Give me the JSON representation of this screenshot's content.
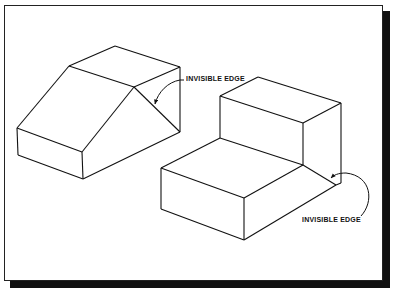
{
  "figure": {
    "stroke_color": "#111111",
    "shadow_color": "#111111",
    "background": "#ffffff"
  },
  "labels": [
    {
      "text": "INVISIBLE EDGE",
      "x": 186,
      "y": 76
    },
    {
      "text": "INVISIBLE EDGE",
      "x": 302,
      "y": 217
    }
  ],
  "shapes": {
    "left_block": {
      "name": "sloped block",
      "edges": [
        [
          [
            69,
            66
          ],
          [
            115,
            46
          ]
        ],
        [
          [
            115,
            46
          ],
          [
            180,
            67
          ]
        ],
        [
          [
            69,
            66
          ],
          [
            134,
            87
          ]
        ],
        [
          [
            134,
            87
          ],
          [
            180,
            67
          ]
        ],
        [
          [
            69,
            66
          ],
          [
            17,
            128
          ]
        ],
        [
          [
            134,
            87
          ],
          [
            82,
            152
          ]
        ],
        [
          [
            134,
            87
          ],
          [
            180,
            132
          ]
        ],
        [
          [
            17,
            128
          ],
          [
            82,
            152
          ]
        ],
        [
          [
            17,
            128
          ],
          [
            18,
            155
          ]
        ],
        [
          [
            82,
            152
          ],
          [
            83,
            179
          ]
        ],
        [
          [
            18,
            155
          ],
          [
            83,
            179
          ]
        ],
        [
          [
            83,
            179
          ],
          [
            180,
            132
          ]
        ],
        [
          [
            180,
            67
          ],
          [
            180,
            132
          ]
        ]
      ]
    },
    "right_block": {
      "name": "stepped block",
      "edges": [
        [
          [
            220,
            96
          ],
          [
            258,
            77
          ]
        ],
        [
          [
            258,
            77
          ],
          [
            341,
            103
          ]
        ],
        [
          [
            220,
            96
          ],
          [
            303,
            123
          ]
        ],
        [
          [
            303,
            123
          ],
          [
            341,
            103
          ]
        ],
        [
          [
            220,
            96
          ],
          [
            220,
            138
          ]
        ],
        [
          [
            303,
            123
          ],
          [
            303,
            165
          ]
        ],
        [
          [
            341,
            103
          ],
          [
            341,
            183
          ]
        ],
        [
          [
            220,
            138
          ],
          [
            161,
            168
          ]
        ],
        [
          [
            220,
            138
          ],
          [
            303,
            165
          ]
        ],
        [
          [
            161,
            168
          ],
          [
            244,
            198
          ]
        ],
        [
          [
            244,
            198
          ],
          [
            303,
            165
          ]
        ],
        [
          [
            303,
            165
          ],
          [
            336,
            185
          ]
        ],
        [
          [
            161,
            168
          ],
          [
            161,
            209
          ]
        ],
        [
          [
            244,
            198
          ],
          [
            244,
            240
          ]
        ],
        [
          [
            161,
            209
          ],
          [
            244,
            240
          ]
        ],
        [
          [
            244,
            240
          ],
          [
            336,
            185
          ]
        ],
        [
          [
            336,
            185
          ],
          [
            341,
            183
          ]
        ]
      ]
    }
  }
}
